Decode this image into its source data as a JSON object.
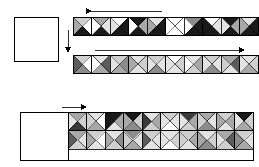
{
  "figure": {
    "type": "diagram",
    "background": "#ffffff",
    "stroke": "#000000",
    "width": 259,
    "height": 167
  },
  "palette": {
    "white": "#ffffff",
    "light": "#e3e3e3",
    "light2": "#cfcfcf",
    "mid": "#a8a8a8",
    "mid2": "#8c8c8c",
    "dark": "#5c5c5c",
    "darker": "#3a3a3a",
    "black": "#1a1a1a",
    "outline": "#000000"
  },
  "shades_legend": [
    {
      "name": "white",
      "hex": "#ffffff"
    },
    {
      "name": "light",
      "hex": "#e3e3e3"
    },
    {
      "name": "light2",
      "hex": "#cfcfcf"
    },
    {
      "name": "mid",
      "hex": "#a8a8a8"
    },
    {
      "name": "mid2",
      "hex": "#8c8c8c"
    },
    {
      "name": "dark",
      "hex": "#5c5c5c"
    },
    {
      "name": "darker",
      "hex": "#3a3a3a"
    },
    {
      "name": "black",
      "hex": "#1a1a1a"
    }
  ],
  "arrows": [
    {
      "id": "arrow-top-left",
      "direction": "left",
      "x1": 162,
      "y1": 11,
      "x2": 86,
      "y2": 11
    },
    {
      "id": "arrow-mid-right",
      "direction": "right",
      "x1": 95,
      "y1": 50,
      "x2": 240,
      "y2": 50
    },
    {
      "id": "arrow-vertical-down",
      "direction": "down",
      "x1": 68,
      "y1": 30,
      "x2": 68,
      "y2": 48
    },
    {
      "id": "arrow-bottom-right",
      "direction": "right",
      "x1": 62,
      "y1": 107,
      "x2": 82,
      "y2": 107
    }
  ],
  "empty_squares": [
    {
      "id": "square-left-top",
      "x": 14,
      "y": 17,
      "w": 44,
      "h": 44
    },
    {
      "id": "square-bottom-left",
      "x": 20,
      "y": 112,
      "w": 48,
      "h": 48
    }
  ],
  "strips": [
    {
      "id": "strip-top",
      "x": 73,
      "y": 17,
      "tile": 18.5,
      "rows": 1,
      "cols": 10,
      "tiles": [
        {
          "n": "n",
          "e": "e",
          "s": "s",
          "w": "w",
          "colors": [
            "light2",
            "white",
            "black",
            "mid"
          ]
        },
        {
          "colors": [
            "mid",
            "light",
            "black",
            "white"
          ]
        },
        {
          "colors": [
            "white",
            "black",
            "black",
            "light"
          ]
        },
        {
          "colors": [
            "black",
            "mid",
            "black",
            "white"
          ]
        },
        {
          "colors": [
            "light",
            "black",
            "black",
            "mid"
          ]
        },
        {
          "colors": [
            "white",
            "white",
            "white",
            "white"
          ]
        },
        {
          "colors": [
            "mid2",
            "black",
            "black",
            "white"
          ]
        },
        {
          "colors": [
            "white",
            "light",
            "black",
            "black"
          ]
        },
        {
          "colors": [
            "black",
            "mid",
            "black",
            "light"
          ]
        },
        {
          "colors": [
            "light",
            "black",
            "black",
            "mid"
          ]
        }
      ]
    },
    {
      "id": "strip-middle",
      "x": 73,
      "y": 55,
      "tile": 18.5,
      "rows": 1,
      "cols": 10,
      "tiles": [
        {
          "colors": [
            "light2",
            "white",
            "mid2",
            "dark"
          ]
        },
        {
          "colors": [
            "light",
            "dark",
            "mid",
            "white"
          ]
        },
        {
          "colors": [
            "light2",
            "mid2",
            "mid",
            "light"
          ]
        },
        {
          "colors": [
            "light",
            "light2",
            "light",
            "mid"
          ]
        },
        {
          "colors": [
            "light2",
            "light",
            "mid2",
            "light"
          ]
        },
        {
          "colors": [
            "white",
            "light2",
            "light",
            "light"
          ]
        },
        {
          "colors": [
            "light",
            "mid",
            "light2",
            "white"
          ]
        },
        {
          "colors": [
            "light2",
            "light",
            "mid2",
            "light"
          ]
        },
        {
          "colors": [
            "mid",
            "dark",
            "light",
            "light2"
          ]
        },
        {
          "colors": [
            "light",
            "light2",
            "mid",
            "light"
          ]
        }
      ]
    }
  ],
  "block": {
    "id": "block-bottom",
    "x": 68,
    "y": 112,
    "tile": 18.5,
    "rows": 2,
    "cols": 10,
    "outer": {
      "x": 20,
      "y": 112,
      "w": 233,
      "h": 48
    },
    "rows_data": [
      [
        {
          "colors": [
            "mid",
            "light2",
            "darker",
            "light"
          ]
        },
        {
          "colors": [
            "light",
            "white",
            "mid",
            "light2"
          ]
        },
        {
          "colors": [
            "black",
            "mid",
            "light",
            "black"
          ]
        },
        {
          "colors": [
            "black",
            "light2",
            "mid2",
            "mid"
          ]
        },
        {
          "colors": [
            "light",
            "mid",
            "light2",
            "darker"
          ]
        },
        {
          "colors": [
            "light2",
            "light",
            "white",
            "light"
          ]
        },
        {
          "colors": [
            "darker",
            "mid",
            "light2",
            "light"
          ]
        },
        {
          "colors": [
            "mid",
            "light",
            "mid2",
            "light2"
          ]
        },
        {
          "colors": [
            "light2",
            "mid",
            "light",
            "mid"
          ]
        },
        {
          "colors": [
            "black",
            "light2",
            "mid",
            "light"
          ]
        }
      ],
      [
        {
          "colors": [
            "mid",
            "light",
            "light2",
            "dark"
          ]
        },
        {
          "colors": [
            "light2",
            "white",
            "light",
            "mid"
          ]
        },
        {
          "colors": [
            "light",
            "mid2",
            "light2",
            "mid"
          ]
        },
        {
          "colors": [
            "mid2",
            "light",
            "mid",
            "light2"
          ]
        },
        {
          "colors": [
            "light2",
            "light",
            "light",
            "dark"
          ]
        },
        {
          "colors": [
            "light",
            "light2",
            "white",
            "light"
          ]
        },
        {
          "colors": [
            "light2",
            "mid",
            "light",
            "light2"
          ]
        },
        {
          "colors": [
            "light",
            "light2",
            "mid2",
            "mid"
          ]
        },
        {
          "colors": [
            "mid",
            "dark",
            "light2",
            "light"
          ]
        },
        {
          "colors": [
            "light2",
            "light",
            "mid",
            "mid2"
          ]
        }
      ]
    ]
  }
}
